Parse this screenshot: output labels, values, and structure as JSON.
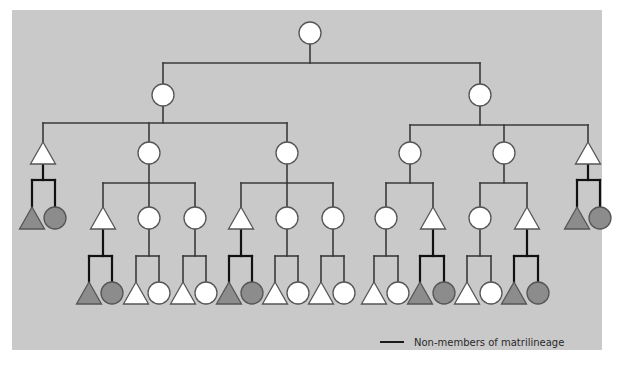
{
  "diagram": {
    "type": "kinship-pedigree",
    "colors": {
      "panel_background": "#c9c9c9",
      "member_fill": "#ffffff",
      "nonmember_fill": "#8c8c8c",
      "member_line": "#3a3a3a",
      "nonmember_line": "#111111",
      "symbol_stroke": "#555555"
    },
    "symbols": {
      "circle": "female",
      "triangle": "male"
    },
    "root": {
      "shape": "circle",
      "member": true
    },
    "generations": [
      {
        "level": 1,
        "nodes": [
          {
            "shape": "circle",
            "member": true
          }
        ]
      },
      {
        "level": 2,
        "nodes": [
          {
            "shape": "circle",
            "member": true
          },
          {
            "shape": "circle",
            "member": true
          }
        ]
      },
      {
        "level": 3,
        "nodes": [
          {
            "shape": "triangle",
            "member": true
          },
          {
            "shape": "circle",
            "member": true
          },
          {
            "shape": "circle",
            "member": true
          },
          {
            "shape": "circle",
            "member": true
          },
          {
            "shape": "circle",
            "member": true
          },
          {
            "shape": "triangle",
            "member": true
          }
        ]
      },
      {
        "level": 4,
        "nodes": [
          {
            "shape": "triangle",
            "member": false
          },
          {
            "shape": "circle",
            "member": false
          },
          {
            "shape": "triangle",
            "member": true
          },
          {
            "shape": "circle",
            "member": true
          },
          {
            "shape": "circle",
            "member": true
          },
          {
            "shape": "triangle",
            "member": true
          },
          {
            "shape": "circle",
            "member": true
          },
          {
            "shape": "circle",
            "member": true
          },
          {
            "shape": "circle",
            "member": true
          },
          {
            "shape": "triangle",
            "member": true
          },
          {
            "shape": "circle",
            "member": true
          },
          {
            "shape": "triangle",
            "member": true
          },
          {
            "shape": "triangle",
            "member": false
          },
          {
            "shape": "circle",
            "member": false
          }
        ]
      },
      {
        "level": 5,
        "nodes_count": 20
      }
    ]
  },
  "legend": {
    "items": [
      {
        "symbol": "black-line",
        "label": "Non-members of matrilineage"
      }
    ]
  }
}
